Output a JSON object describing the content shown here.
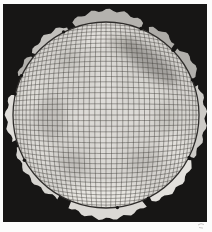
{
  "figure": {
    "canvas": {
      "width": 212,
      "height": 232,
      "page_color": "#fcfcfb"
    },
    "plate": {
      "x": 3,
      "y": 4,
      "width": 204,
      "height": 218,
      "color": "#171615"
    },
    "disk": {
      "cx": 106,
      "cy": 115,
      "r": 93,
      "fill": "#d5d3cf",
      "rim_color": "#2e2c2a",
      "rim_width": 1.3
    },
    "grid": {
      "half_lines": 20,
      "max_angle_deg": 60,
      "color": "#45433f",
      "stroke_width": 0.55,
      "opacity": 0.85
    },
    "lobes": [
      {
        "from_deg": 340,
        "to_deg": 22,
        "out": 12,
        "color": "#b4b2ae"
      },
      {
        "from_deg": 26,
        "to_deg": 45,
        "out": 8,
        "color": "#aeaca8"
      },
      {
        "from_deg": 47,
        "to_deg": 68,
        "out": 9,
        "color": "#b2b0ac"
      },
      {
        "from_deg": 72,
        "to_deg": 117,
        "out": 7,
        "color": "#cdcbc7"
      },
      {
        "from_deg": 118,
        "to_deg": 152,
        "out": 9,
        "color": "#e3e1dd"
      },
      {
        "from_deg": 156,
        "to_deg": 202,
        "out": 11,
        "color": "#dbd9d5"
      },
      {
        "from_deg": 210,
        "to_deg": 250,
        "out": 6,
        "color": "#d6d4d0"
      },
      {
        "from_deg": 254,
        "to_deg": 283,
        "out": 7,
        "color": "#e0deda"
      },
      {
        "from_deg": 294,
        "to_deg": 308,
        "out": 5,
        "color": "#b2b0ac"
      },
      {
        "from_deg": 310,
        "to_deg": 336,
        "out": 7,
        "color": "#c2c0bc"
      }
    ],
    "shading": {
      "dark": [
        {
          "cx": 150,
          "cy": 62,
          "rx": 34,
          "ry": 11,
          "rot": 38,
          "color": "#6e6c68",
          "opacity": 0.5
        },
        {
          "cx": 122,
          "cy": 44,
          "rx": 15,
          "ry": 8,
          "rot": 15,
          "color": "#88867f",
          "opacity": 0.38
        },
        {
          "cx": 52,
          "cy": 118,
          "rx": 15,
          "ry": 21,
          "rot": 0,
          "color": "#8e8c88",
          "opacity": 0.3
        },
        {
          "cx": 68,
          "cy": 60,
          "rx": 12,
          "ry": 9,
          "rot": -30,
          "color": "#908e8a",
          "opacity": 0.28
        },
        {
          "cx": 73,
          "cy": 163,
          "rx": 15,
          "ry": 11,
          "rot": 25,
          "color": "#8e8c88",
          "opacity": 0.3
        },
        {
          "cx": 143,
          "cy": 161,
          "rx": 16,
          "ry": 11,
          "rot": -20,
          "color": "#8e8c88",
          "opacity": 0.26
        },
        {
          "cx": 166,
          "cy": 118,
          "rx": 11,
          "ry": 16,
          "rot": 0,
          "color": "#96948f",
          "opacity": 0.22
        },
        {
          "cx": 106,
          "cy": 118,
          "rx": 12,
          "ry": 12,
          "rot": 0,
          "color": "#9a9894",
          "opacity": 0.15
        }
      ],
      "light": [
        {
          "cx": 106,
          "cy": 38,
          "rx": 26,
          "ry": 10,
          "rot": 0,
          "color": "#f3f1ed",
          "opacity": 0.55
        },
        {
          "cx": 104,
          "cy": 196,
          "rx": 42,
          "ry": 13,
          "rot": 0,
          "color": "#f5f3ef",
          "opacity": 0.6
        },
        {
          "cx": 106,
          "cy": 112,
          "rx": 11,
          "ry": 58,
          "rot": 0,
          "color": "#f0eeea",
          "opacity": 0.4
        },
        {
          "cx": 106,
          "cy": 115,
          "rx": 58,
          "ry": 10,
          "rot": 0,
          "color": "#eeece8",
          "opacity": 0.35
        },
        {
          "cx": 33,
          "cy": 94,
          "rx": 10,
          "ry": 22,
          "rot": 15,
          "color": "#efede9",
          "opacity": 0.4
        },
        {
          "cx": 178,
          "cy": 150,
          "rx": 12,
          "ry": 24,
          "rot": -25,
          "color": "#f1efeb",
          "opacity": 0.45
        },
        {
          "cx": 40,
          "cy": 150,
          "rx": 10,
          "ry": 18,
          "rot": -20,
          "color": "#efede9",
          "opacity": 0.35
        },
        {
          "cx": 150,
          "cy": 92,
          "rx": 18,
          "ry": 10,
          "rot": 20,
          "color": "#eceae6",
          "opacity": 0.3
        }
      ]
    },
    "rim_marks_deg": [
      22,
      46,
      68,
      117,
      153,
      173,
      241,
      283,
      295,
      333
    ],
    "rim_mark": {
      "radius": 1.7,
      "color": "#161514"
    },
    "corner_artifact": {
      "x": 198,
      "y": 224,
      "color": "#b8b6b4",
      "opacity": 0.85
    }
  }
}
